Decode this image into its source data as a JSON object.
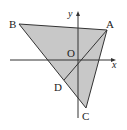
{
  "diagram": {
    "type": "coordinate-geometry",
    "fill_color": "#c8c8c8",
    "stroke_color": "#333333",
    "axes": {
      "x_label": "x",
      "y_label": "y",
      "origin_label": "O"
    },
    "points": {
      "A": {
        "label": "A",
        "px": [
          107,
          30
        ]
      },
      "B": {
        "label": "B",
        "px": [
          19,
          24
        ]
      },
      "C": {
        "label": "C",
        "px": [
          86,
          108
        ]
      },
      "D": {
        "label": "D",
        "px": [
          64,
          80
        ]
      },
      "O": {
        "label": "O",
        "px": [
          78,
          60
        ]
      }
    },
    "segments": [
      "AB",
      "BC",
      "CA",
      "AD"
    ]
  }
}
